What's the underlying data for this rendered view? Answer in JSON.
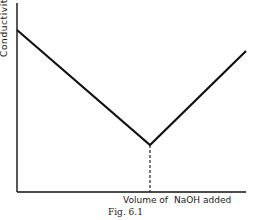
{
  "chart_data": {
    "type": "line",
    "title": "",
    "caption": "Fig. 6.1",
    "xlabel": "Volume of NaOH added",
    "ylabel": "Conductivity",
    "grid": false,
    "legend": null,
    "ticks": {
      "x": [],
      "y": []
    },
    "series": [
      {
        "name": "Conductivity curve",
        "points": [
          {
            "x": 0.0,
            "y": 0.85
          },
          {
            "x": 0.58,
            "y": 0.25
          },
          {
            "x": 1.0,
            "y": 0.74
          }
        ]
      }
    ],
    "annotations": [
      {
        "type": "dashed-vertical",
        "x": 0.58,
        "label": "equivalence point",
        "from_y": 0,
        "to_y": 0.25
      }
    ],
    "pixel_geometry": {
      "axis_origin": [
        17,
        192
      ],
      "y_axis_top": [
        17,
        3
      ],
      "x_axis_end": [
        246,
        192
      ],
      "polyline": [
        [
          17,
          30
        ],
        [
          150,
          145
        ],
        [
          246,
          51
        ]
      ],
      "dashed_line": [
        [
          150,
          145
        ],
        [
          150,
          192
        ]
      ]
    },
    "colors": {
      "line": "#111111",
      "axis": "#111111",
      "background": "#ffffff"
    }
  },
  "labels": {
    "ylabel": "Conductivity",
    "xlabel_part1": "Volume of",
    "xlabel_part2": "NaOH added",
    "caption": "Fig. 6.1"
  }
}
